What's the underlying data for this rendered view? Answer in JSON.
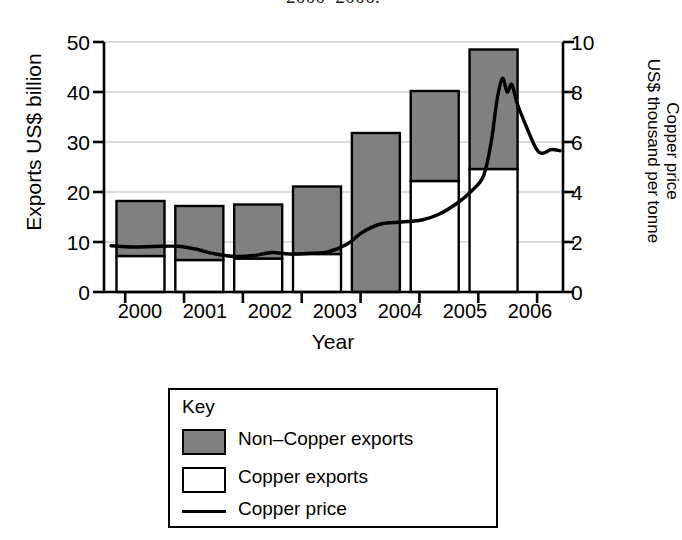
{
  "title": "2000–2006.",
  "axes": {
    "x": {
      "label": "Year",
      "ticks": [
        "2000",
        "2001",
        "2002",
        "2003",
        "2004",
        "2005",
        "2006"
      ]
    },
    "y_left": {
      "label": "Exports US$ billion",
      "ticks": [
        "0",
        "10",
        "20",
        "30",
        "40",
        "50"
      ],
      "min": 0,
      "max": 50
    },
    "y_right": {
      "label_line1": "Copper price",
      "label_line2": "US$ thousand per tonne",
      "ticks": [
        "0",
        "2",
        "4",
        "6",
        "8",
        "10"
      ],
      "min": 0,
      "max": 10
    }
  },
  "legend": {
    "heading": "Key",
    "items": [
      {
        "label": "Non–Copper exports",
        "marker": "filled-box",
        "color": "#808080"
      },
      {
        "label": "Copper exports",
        "marker": "empty-box",
        "color": "#ffffff"
      },
      {
        "label": "Copper price",
        "marker": "line",
        "color": "#000000"
      }
    ]
  },
  "colors": {
    "non_copper_fill": "#808080",
    "copper_fill": "#ffffff",
    "bar_stroke": "#000000",
    "price_line": "#000000",
    "grid": "#b8b8b8",
    "axis": "#000000",
    "background": "#ffffff"
  },
  "chart_data": {
    "type": "bar",
    "title": "2000–2006.",
    "xlabel": "Year",
    "ylabel": "Exports US$ billion",
    "y2label": "Copper price US$ thousand per tonne",
    "ylim": [
      0,
      50
    ],
    "y2lim": [
      0,
      10
    ],
    "grid": true,
    "legend_position": "below-plot",
    "categories": [
      "2000",
      "2001",
      "2002",
      "2003",
      "2004",
      "2005",
      "2006"
    ],
    "stacked": true,
    "series": [
      {
        "name": "Copper exports",
        "type": "bar",
        "axis": "left",
        "color": "#ffffff",
        "values": [
          7.2,
          6.4,
          6.7,
          7.6,
          0.0,
          22.2,
          24.6
        ]
      },
      {
        "name": "Non–Copper exports",
        "type": "bar",
        "axis": "left",
        "color": "#808080",
        "values": [
          11.0,
          10.8,
          10.8,
          13.5,
          31.8,
          18.0,
          23.9
        ]
      }
    ],
    "totals": [
      18.2,
      17.2,
      17.5,
      21.1,
      31.8,
      40.2,
      48.5
    ],
    "line_series": {
      "name": "Copper price",
      "type": "line",
      "axis": "right",
      "color": "#000000",
      "units": "US$ thousand per tonne",
      "points": [
        {
          "x": 1999.62,
          "y": 1.85
        },
        {
          "x": 2000.0,
          "y": 1.8
        },
        {
          "x": 2000.35,
          "y": 1.82
        },
        {
          "x": 2000.75,
          "y": 1.83
        },
        {
          "x": 2001.05,
          "y": 1.72
        },
        {
          "x": 2001.4,
          "y": 1.52
        },
        {
          "x": 2001.75,
          "y": 1.42
        },
        {
          "x": 2002.05,
          "y": 1.46
        },
        {
          "x": 2002.35,
          "y": 1.58
        },
        {
          "x": 2002.65,
          "y": 1.52
        },
        {
          "x": 2003.0,
          "y": 1.55
        },
        {
          "x": 2003.3,
          "y": 1.6
        },
        {
          "x": 2003.62,
          "y": 1.9
        },
        {
          "x": 2003.9,
          "y": 2.4
        },
        {
          "x": 2004.2,
          "y": 2.72
        },
        {
          "x": 2004.55,
          "y": 2.8
        },
        {
          "x": 2004.9,
          "y": 2.88
        },
        {
          "x": 2005.2,
          "y": 3.12
        },
        {
          "x": 2005.5,
          "y": 3.55
        },
        {
          "x": 2005.75,
          "y": 4.05
        },
        {
          "x": 2005.95,
          "y": 4.65
        },
        {
          "x": 2006.08,
          "y": 6.0
        },
        {
          "x": 2006.18,
          "y": 7.7
        },
        {
          "x": 2006.27,
          "y": 8.55
        },
        {
          "x": 2006.35,
          "y": 8.0
        },
        {
          "x": 2006.43,
          "y": 8.3
        },
        {
          "x": 2006.52,
          "y": 7.55
        },
        {
          "x": 2006.68,
          "y": 6.6
        },
        {
          "x": 2006.84,
          "y": 5.75
        },
        {
          "x": 2006.95,
          "y": 5.55
        },
        {
          "x": 2007.1,
          "y": 5.7
        },
        {
          "x": 2007.25,
          "y": 5.65
        }
      ],
      "peak": {
        "x": 2006.27,
        "y": 8.55
      },
      "start": {
        "x": 1999.62,
        "y": 1.85
      },
      "end": {
        "x": 2007.25,
        "y": 5.65
      }
    }
  }
}
